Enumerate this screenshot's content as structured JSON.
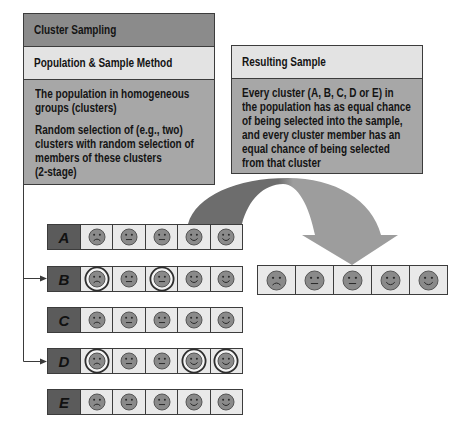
{
  "left_panel": {
    "title": "Cluster Sampling",
    "subtitle": "Population & Sample Method",
    "paragraphs": [
      {
        "lines": [
          "The population in homogeneous",
          "groups (clusters)"
        ]
      },
      {
        "lines": [
          "Random selection of (e.g., two)",
          "clusters with random selection of",
          "members of these clusters",
          "(2-stage)"
        ]
      }
    ]
  },
  "right_panel": {
    "title": "Resulting Sample",
    "lines": [
      "Every cluster (A, B, C, D or E) in",
      "the population has as equal chance",
      "of being selected into the sample,",
      "and every cluster member has an",
      "equal chance of being selected",
      "from that cluster"
    ]
  },
  "colors": {
    "arrow_dark": "#6d6d6d",
    "arrow_light": "#9d9d9d",
    "face_fill": "#8a8a8a",
    "face_stroke": "#555555",
    "ring": "#2e2e2e"
  },
  "clusters": [
    {
      "label": "A",
      "selected_cluster": false,
      "members": [
        {
          "expr": "frown",
          "selected": false
        },
        {
          "expr": "neutral",
          "selected": false
        },
        {
          "expr": "neutral",
          "selected": false
        },
        {
          "expr": "smile",
          "selected": false
        },
        {
          "expr": "smile",
          "selected": false
        }
      ]
    },
    {
      "label": "B",
      "selected_cluster": true,
      "members": [
        {
          "expr": "frown",
          "selected": true
        },
        {
          "expr": "neutral",
          "selected": false
        },
        {
          "expr": "neutral",
          "selected": true
        },
        {
          "expr": "smile",
          "selected": false
        },
        {
          "expr": "smile",
          "selected": false
        }
      ]
    },
    {
      "label": "C",
      "selected_cluster": false,
      "members": [
        {
          "expr": "frown",
          "selected": false
        },
        {
          "expr": "neutral",
          "selected": false
        },
        {
          "expr": "neutral",
          "selected": false
        },
        {
          "expr": "smile",
          "selected": false
        },
        {
          "expr": "smile",
          "selected": false
        }
      ]
    },
    {
      "label": "D",
      "selected_cluster": true,
      "members": [
        {
          "expr": "frown",
          "selected": true
        },
        {
          "expr": "neutral",
          "selected": false
        },
        {
          "expr": "neutral",
          "selected": false
        },
        {
          "expr": "smile",
          "selected": true
        },
        {
          "expr": "smile",
          "selected": true
        }
      ]
    },
    {
      "label": "E",
      "selected_cluster": false,
      "members": [
        {
          "expr": "frown",
          "selected": false
        },
        {
          "expr": "neutral",
          "selected": false
        },
        {
          "expr": "neutral",
          "selected": false
        },
        {
          "expr": "smile",
          "selected": false
        },
        {
          "expr": "smile",
          "selected": false
        }
      ]
    }
  ],
  "result_sample": [
    {
      "expr": "frown"
    },
    {
      "expr": "neutral"
    },
    {
      "expr": "neutral"
    },
    {
      "expr": "smile"
    },
    {
      "expr": "smile"
    }
  ]
}
